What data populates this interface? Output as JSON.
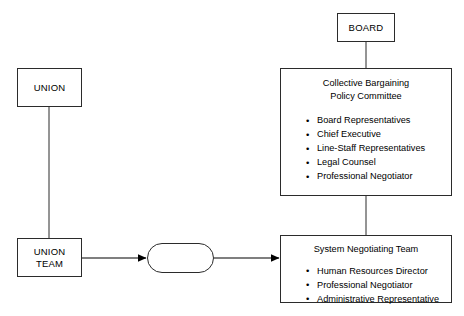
{
  "diagram": {
    "colors": {
      "stroke": "#2b2b2b",
      "fill": "#ffffff",
      "text": "#000000"
    },
    "nodes": {
      "board": {
        "label": "BOARD"
      },
      "union": {
        "label": "UNION"
      },
      "union_team": {
        "label_line1": "UNION",
        "label_line2": "TEAM"
      },
      "policy_committee": {
        "title_line1": "Collective Bargaining",
        "title_line2": "Policy Committee",
        "members": [
          "Board Representatives",
          "Chief Executive",
          "Line-Staff Representatives",
          "Legal Counsel",
          "Professional Negotiator"
        ]
      },
      "negotiating_team": {
        "title": "System Negotiating Team",
        "members": [
          "Human Resources Director",
          "Professional Negotiator",
          "Administrative Representative"
        ]
      },
      "bargaining_table": {
        "label": ""
      }
    },
    "connectors": [
      {
        "name": "board-to-policy-committee",
        "style": "line",
        "orientation": "vertical"
      },
      {
        "name": "policy-committee-to-negotiating-team",
        "style": "line",
        "orientation": "vertical"
      },
      {
        "name": "union-to-union-team",
        "style": "line",
        "orientation": "vertical"
      },
      {
        "name": "union-team-to-bargaining-table",
        "style": "arrow",
        "orientation": "horizontal"
      },
      {
        "name": "bargaining-table-to-negotiating-team",
        "style": "arrow",
        "orientation": "horizontal"
      }
    ]
  }
}
